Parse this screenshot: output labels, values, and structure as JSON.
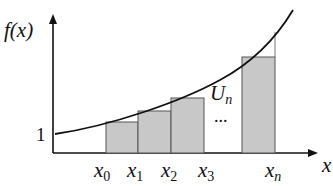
{
  "diagram": {
    "y_axis_label": "f(x)",
    "x_axis_label": "x",
    "y_tick_label": "1",
    "region_label": "U",
    "region_label_sub": "n",
    "ellipsis": "...",
    "partition_labels": [
      {
        "base": "x",
        "sub": "0"
      },
      {
        "base": "x",
        "sub": "1"
      },
      {
        "base": "x",
        "sub": "2"
      },
      {
        "base": "x",
        "sub": "3"
      },
      {
        "base": "x",
        "sub": "n"
      }
    ],
    "colors": {
      "axis": "#111111",
      "curve": "#111111",
      "bar_fill": "#c8c8c8",
      "bar_stroke": "#555555"
    }
  }
}
